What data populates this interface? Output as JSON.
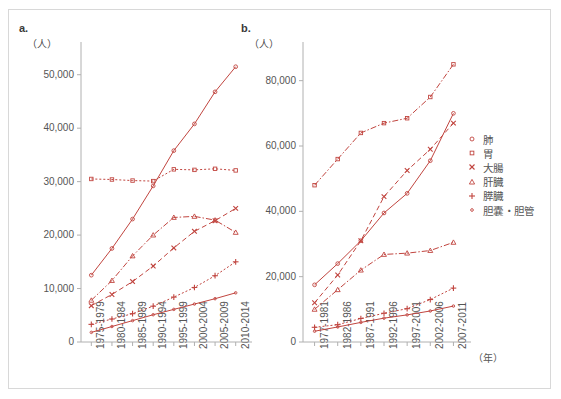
{
  "figure": {
    "border_color": "#d8d8d8",
    "series_color": "#c1453f",
    "axis_color": "#b0b0b0",
    "text_color": "#555555"
  },
  "legend": {
    "items": [
      {
        "label": "肺",
        "marker": "circle-marker",
        "key": "lung"
      },
      {
        "label": "胃",
        "marker": "square-marker",
        "key": "stomach"
      },
      {
        "label": "大腸",
        "marker": "cross-marker",
        "key": "colon"
      },
      {
        "label": "肝臓",
        "marker": "triangle-marker",
        "key": "liver"
      },
      {
        "label": "膵臓",
        "marker": "plus-marker",
        "key": "pancreas"
      },
      {
        "label": "胆嚢・胆管",
        "marker": "small-circle-marker",
        "key": "gallbladder"
      }
    ]
  },
  "chart_data": [
    {
      "type": "line",
      "panel": "a.",
      "title": "",
      "ylabel": "（人）",
      "xlabel": "",
      "ylim": [
        0,
        55000
      ],
      "yticks": [
        0,
        10000,
        20000,
        30000,
        40000,
        50000
      ],
      "ytick_labels": [
        "0",
        "10,000",
        "20,000",
        "30,000",
        "40,000",
        "50,000"
      ],
      "categories": [
        "1975-1979",
        "1980-1984",
        "1985-1989",
        "1990-1994",
        "1995-1999",
        "2000-2004",
        "2005-2009",
        "2010-2014"
      ],
      "grid": false,
      "legend_position": "right-outside",
      "series": [
        {
          "name": "肺",
          "marker": "circle",
          "dash": "solid",
          "values": [
            12500,
            17500,
            23000,
            29200,
            35800,
            40800,
            46800,
            51500
          ]
        },
        {
          "name": "胃",
          "marker": "square",
          "dash": "dotted",
          "values": [
            30500,
            30400,
            30200,
            30100,
            32300,
            32200,
            32400,
            32100
          ]
        },
        {
          "name": "大腸",
          "marker": "cross",
          "dash": "dashed",
          "values": [
            6800,
            8900,
            11300,
            14200,
            17600,
            20700,
            22700,
            25000
          ]
        },
        {
          "name": "肝臓",
          "marker": "triangle",
          "dash": "dashdot",
          "values": [
            7800,
            11500,
            16100,
            20000,
            23300,
            23500,
            22800,
            20500
          ]
        },
        {
          "name": "膵臓",
          "marker": "plus",
          "dash": "dotted",
          "values": [
            3300,
            4300,
            5300,
            6700,
            8400,
            10200,
            12400,
            15000
          ]
        },
        {
          "name": "胆嚢・胆管",
          "marker": "small-circle",
          "dash": "solid",
          "values": [
            1800,
            2900,
            4000,
            5100,
            6100,
            7100,
            8100,
            9200
          ]
        }
      ]
    },
    {
      "type": "line",
      "panel": "b.",
      "title": "",
      "ylabel": "（人）",
      "xlabel": "（年）",
      "ylim": [
        0,
        90000
      ],
      "yticks": [
        0,
        20000,
        40000,
        60000,
        80000
      ],
      "ytick_labels": [
        "0",
        "20,000",
        "40,000",
        "60,000",
        "80,000"
      ],
      "categories": [
        "1977-1981",
        "1982-1986",
        "1987-1991",
        "1992-1996",
        "1997-2001",
        "2002-2006",
        "2007-2011"
      ],
      "grid": false,
      "legend_position": "right-outside",
      "series": [
        {
          "name": "胃",
          "marker": "square",
          "dash": "dashdot",
          "values": [
            48000,
            56000,
            64000,
            67000,
            68500,
            75000,
            85000
          ]
        },
        {
          "name": "肺",
          "marker": "circle",
          "dash": "solid",
          "values": [
            17500,
            24000,
            31000,
            39500,
            45500,
            55500,
            70000
          ]
        },
        {
          "name": "大腸",
          "marker": "cross",
          "dash": "dashed",
          "values": [
            12000,
            20500,
            31000,
            44500,
            52500,
            59000,
            67000
          ]
        },
        {
          "name": "肝臓",
          "marker": "triangle",
          "dash": "dashdot",
          "values": [
            10000,
            16000,
            22000,
            26800,
            27200,
            28000,
            30500
          ]
        },
        {
          "name": "膵臓",
          "marker": "plus",
          "dash": "dotted",
          "values": [
            4500,
            5300,
            7200,
            8800,
            10200,
            13000,
            16500
          ]
        },
        {
          "name": "胆嚢・胆管",
          "marker": "small-circle",
          "dash": "solid",
          "values": [
            3300,
            4600,
            6000,
            7300,
            8300,
            9500,
            11000
          ]
        }
      ]
    }
  ]
}
